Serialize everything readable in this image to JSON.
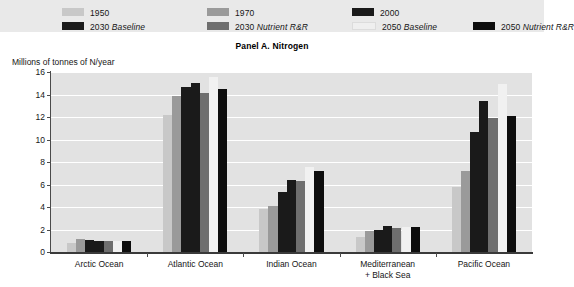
{
  "panel": {
    "title": "Panel A. Nitrogen",
    "unit_label": "Millions of tonnes of N/year"
  },
  "legend": {
    "items": [
      {
        "label": "1950",
        "italic": "",
        "color": "#c8c8c8"
      },
      {
        "label": "1970",
        "italic": "",
        "color": "#9a9a9a"
      },
      {
        "label": "2000",
        "italic": "",
        "color": "#1a1a1a"
      },
      {
        "label": "2030 ",
        "italic": "Baseline",
        "color": "#1a1a1a"
      },
      {
        "label": "2030 ",
        "italic": "Nutrient R&R",
        "color": "#6e6e6e"
      },
      {
        "label": "2050 ",
        "italic": "Baseline",
        "color": "#efefef"
      },
      {
        "label": "2050 ",
        "italic": "Nutrient R&R",
        "color": "#0d0d0d"
      }
    ]
  },
  "chart_data": {
    "type": "bar",
    "title": "Panel A. Nitrogen",
    "xlabel": "",
    "ylabel": "Millions of tonnes of N/year",
    "ylim": [
      0,
      16
    ],
    "yticks": [
      0,
      2,
      4,
      6,
      8,
      10,
      12,
      14,
      16
    ],
    "ytick_labels": [
      "0",
      "2",
      "4",
      "6",
      "8",
      "10",
      "12",
      "14",
      "16"
    ],
    "grid": true,
    "legend_position": "top",
    "categories": [
      "Arctic Ocean",
      "Atlantic Ocean",
      "Indian Ocean",
      "Mediterranean\n+ Black Sea",
      "Pacific Ocean"
    ],
    "category_lines": [
      [
        "Arctic Ocean"
      ],
      [
        "Atlantic Ocean"
      ],
      [
        "Indian Ocean"
      ],
      [
        "Mediterranean",
        "+ Black Sea"
      ],
      [
        "Pacific Ocean"
      ]
    ],
    "series": [
      {
        "name": "1950",
        "color": "#c8c8c8",
        "values": [
          0.8,
          12.2,
          3.8,
          1.3,
          5.8
        ]
      },
      {
        "name": "1970",
        "color": "#9a9a9a",
        "values": [
          1.2,
          13.9,
          4.1,
          1.9,
          7.2
        ]
      },
      {
        "name": "2000",
        "color": "#1a1a1a",
        "values": [
          1.1,
          14.7,
          5.3,
          2.0,
          10.7
        ]
      },
      {
        "name": "2030 Baseline",
        "color": "#1a1a1a",
        "values": [
          1.0,
          15.0,
          6.4,
          2.3,
          13.4
        ]
      },
      {
        "name": "2030 Nutrient R&R",
        "color": "#6e6e6e",
        "values": [
          1.0,
          14.1,
          6.3,
          2.1,
          11.9
        ]
      },
      {
        "name": "2050 Baseline",
        "color": "#efefef",
        "values": [
          1.0,
          15.6,
          7.6,
          2.2,
          14.9
        ]
      },
      {
        "name": "2050 Nutrient R&R",
        "color": "#0d0d0d",
        "values": [
          1.0,
          14.5,
          7.2,
          2.2,
          12.1
        ]
      }
    ]
  }
}
